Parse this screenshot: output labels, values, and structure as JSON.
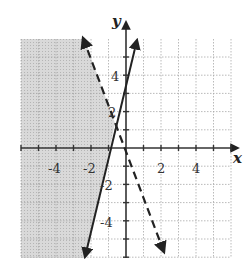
{
  "chart_data": {
    "type": "line",
    "title": "",
    "xlabel": "x",
    "ylabel": "y",
    "xlim": [
      -6,
      6
    ],
    "ylim": [
      -6,
      6
    ],
    "grid": true,
    "x_tick_labels": [
      "-4",
      "-2",
      "2",
      "4"
    ],
    "y_tick_labels": [
      "4",
      "2",
      "-2",
      "-4"
    ],
    "series": [
      {
        "name": "solid boundary line",
        "style": "solid",
        "approx_equation": "y = 4x + 3.5",
        "points": [
          [
            -3.0,
            -6.1
          ],
          [
            0.6,
            6.0
          ]
        ]
      },
      {
        "name": "dashed boundary line",
        "style": "dashed",
        "approx_equation": "y = -2.5x",
        "points": [
          [
            -2.4,
            6.1
          ],
          [
            2.2,
            -5.8
          ]
        ]
      }
    ],
    "shaded_region": "left of both lines (gray)",
    "colors": {
      "shade": "#cfcfcf",
      "line": "#222222",
      "grid": "#9a9a9a"
    }
  }
}
